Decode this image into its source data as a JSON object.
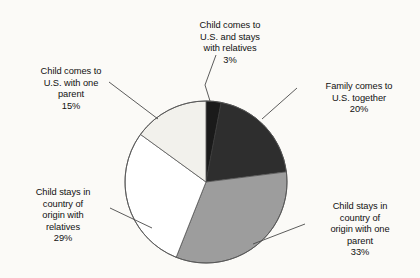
{
  "chart_data": {
    "type": "pie",
    "title": "",
    "xlabel": "",
    "ylabel": "",
    "legend_position": "callout-labels",
    "grid": false,
    "total": 100,
    "units": "percent",
    "start_angle_oclock": 12,
    "direction": "clockwise",
    "categories": [
      "Child comes to U.S. and stays with relatives",
      "Family comes to U.S. together",
      "Child stays in country of origin with one parent",
      "Child stays in country of origin with relatives",
      "Child comes to U.S. with one parent"
    ],
    "values": [
      3,
      20,
      33,
      29,
      15
    ],
    "slices": [
      {
        "label_lines": [
          "Child comes to",
          "U.S. and stays",
          "with relatives"
        ],
        "value": 3,
        "value_text": "3%",
        "fill": "#1a1a1a",
        "stroke": "#3a3a3a"
      },
      {
        "label_lines": [
          "Family comes to",
          "U.S. together"
        ],
        "value": 20,
        "value_text": "20%",
        "fill": "#2e2e2e",
        "stroke": "#3a3a3a"
      },
      {
        "label_lines": [
          "Child stays in",
          "country of",
          "origin with one",
          "parent"
        ],
        "value": 33,
        "value_text": "33%",
        "fill": "#9d9d9d",
        "stroke": "#555555"
      },
      {
        "label_lines": [
          "Child stays in",
          "country of",
          "origin with",
          "relatives"
        ],
        "value": 29,
        "value_text": "29%",
        "fill": "#ffffff",
        "stroke": "#555555"
      },
      {
        "label_lines": [
          "Child comes to",
          "U.S. with one",
          "parent"
        ],
        "value": 15,
        "value_text": "15%",
        "fill": "#f2f1ec",
        "stroke": "#555555"
      }
    ]
  },
  "labels": {
    "top": {
      "text": "Child comes to\nU.S. and stays\nwith relatives",
      "pct": "3%"
    },
    "right": {
      "text": "Family comes to\nU.S. together",
      "pct": "20%"
    },
    "bottom_right": {
      "text": "Child stays in\ncountry of\norigin with one\nparent",
      "pct": "33%"
    },
    "bottom_left": {
      "text": "Child stays in\ncountry of\norigin with\nrelatives",
      "pct": "29%"
    },
    "top_left": {
      "text": "Child comes to\nU.S. with one\nparent",
      "pct": "15%"
    }
  },
  "colors": {
    "background": "#fbfaf7",
    "text": "#111111",
    "leader_line": "#4a4a4a",
    "slice_black": "#1a1a1a",
    "slice_dark_gray": "#2e2e2e",
    "slice_mid_gray": "#9d9d9d",
    "slice_white": "#ffffff",
    "slice_light_gray": "#f2f1ec"
  }
}
